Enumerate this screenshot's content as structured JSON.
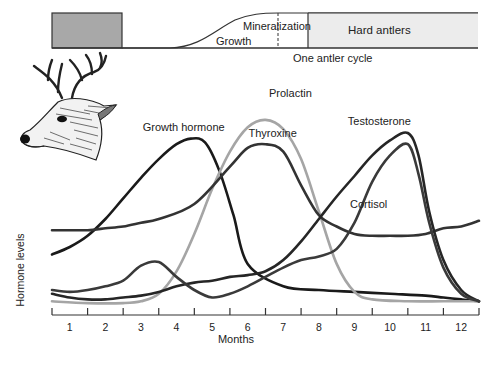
{
  "antler_bar": {
    "velvet_shed_block": {
      "from_month": 0.0,
      "to_month": 2.0,
      "color": "#a8a8a8"
    },
    "labels": {
      "growth": "Growth",
      "mineralization": "Mineralization",
      "hard_antlers": "Hard antlers",
      "cycle": "One antler cycle"
    },
    "hard_antlers_fill": "#ececec"
  },
  "chart_data": {
    "type": "line",
    "title": "",
    "xlabel": "Months",
    "ylabel": "Hormone levels",
    "x_ticks": [
      "1",
      "2",
      "3",
      "4",
      "5",
      "6",
      "7",
      "8",
      "9",
      "10",
      "11",
      "12"
    ],
    "xlim": [
      0,
      12
    ],
    "ylim": [
      0,
      100
    ],
    "grid": false,
    "legend": "inline labels",
    "series": [
      {
        "name": "Growth hormone",
        "color": "#1a1a1a",
        "x": [
          0,
          0.5,
          1,
          1.5,
          2,
          2.5,
          3,
          3.5,
          3.9,
          4.3,
          4.7,
          5.1,
          5.5,
          6.5,
          7.5,
          8.5,
          9.5,
          10.5,
          11,
          11.5,
          12
        ],
        "y": [
          27,
          31,
          37,
          46,
          57,
          68,
          78,
          86,
          89,
          87,
          72,
          48,
          22,
          10,
          8,
          7,
          6,
          5,
          4,
          3,
          2
        ]
      },
      {
        "name": "Prolactin",
        "color": "#a5a5a5",
        "x": [
          0,
          1,
          2,
          2.5,
          3,
          3.5,
          4,
          4.5,
          5,
          5.5,
          6,
          6.5,
          7,
          7.5,
          8,
          8.5,
          9,
          10,
          11,
          12
        ],
        "y": [
          2,
          1,
          1,
          2,
          6,
          18,
          38,
          62,
          82,
          95,
          99,
          94,
          78,
          50,
          22,
          7,
          3,
          2,
          2,
          2
        ]
      },
      {
        "name": "Thyroxine",
        "color": "#333333",
        "x": [
          0,
          0.5,
          1,
          1.5,
          2,
          2.5,
          3,
          4,
          5,
          5.5,
          6,
          6.5,
          7,
          7.5,
          8,
          8.5,
          9,
          9.5,
          10,
          10.5,
          11,
          11.5,
          12
        ],
        "y": [
          40,
          40,
          40,
          41,
          42,
          44,
          46,
          54,
          74,
          84,
          86,
          82,
          64,
          48,
          42,
          38,
          37,
          37,
          37,
          38,
          41,
          42,
          45
        ]
      },
      {
        "name": "Testosterone",
        "color": "#262626",
        "x": [
          0,
          0.5,
          1,
          1.5,
          2,
          2.5,
          3,
          3.5,
          4,
          4.5,
          5,
          5.5,
          6,
          6.5,
          7,
          7.5,
          8,
          8.5,
          9,
          9.5,
          10,
          10.3,
          10.6,
          11,
          11.5,
          12
        ],
        "y": [
          6,
          4,
          3,
          3,
          4,
          5,
          7,
          10,
          12,
          13,
          15,
          16,
          18,
          24,
          34,
          46,
          58,
          69,
          80,
          88,
          92,
          80,
          50,
          24,
          8,
          2
        ]
      },
      {
        "name": "Cortisol",
        "color": "#3a3a3a",
        "x": [
          0,
          0.5,
          1,
          1.5,
          2,
          2.5,
          3,
          3.5,
          4,
          4.5,
          5,
          5.5,
          6,
          6.5,
          7,
          7.5,
          8,
          8.5,
          9,
          9.5,
          10,
          10.3,
          10.6,
          11,
          11.5,
          12
        ],
        "y": [
          8,
          7,
          8,
          10,
          13,
          21,
          23,
          15,
          8,
          4,
          6,
          10,
          15,
          20,
          24,
          26,
          30,
          44,
          66,
          80,
          86,
          70,
          44,
          20,
          6,
          2
        ]
      }
    ],
    "series_labels": [
      {
        "text": "Growth hormone",
        "x_month": 3.7,
        "y": 93
      },
      {
        "text": "Prolactin",
        "x_month": 6.7,
        "y": 111
      },
      {
        "text": "Thyroxine",
        "x_month": 6.2,
        "y": 90
      },
      {
        "text": "Testosterone",
        "x_month": 9.2,
        "y": 96
      },
      {
        "text": "Cortisol",
        "x_month": 8.9,
        "y": 52
      }
    ]
  }
}
